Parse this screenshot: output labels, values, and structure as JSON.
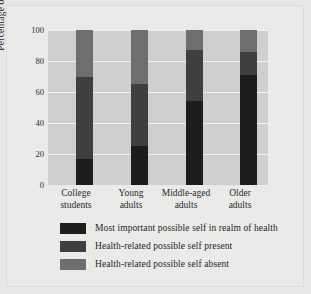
{
  "chart_data": {
    "type": "bar",
    "subtype": "stacked-bar",
    "title": "",
    "xlabel": "",
    "ylabel": "Percentage of sample",
    "ylim": [
      0,
      100
    ],
    "yticks": [
      100,
      80,
      60,
      40,
      20,
      0
    ],
    "ytick_labels": [
      "100",
      "80",
      "60",
      "40",
      "20",
      "0"
    ],
    "grid": true,
    "grid_axis": "y",
    "legend_position": "below",
    "stacked_total": 100,
    "categories": [
      "College students",
      "Young adults",
      "Middle-aged adults",
      "Older adults"
    ],
    "category_lines": [
      [
        "College",
        "students"
      ],
      [
        "Young",
        "adults"
      ],
      [
        "Middle-aged",
        "adults"
      ],
      [
        "Older",
        "adults"
      ]
    ],
    "series": [
      {
        "name": "Most important possible self in realm of health",
        "color": "#1d1d1d",
        "values": [
          17,
          25,
          54,
          71
        ]
      },
      {
        "name": "Health-related possible self present",
        "color": "#3f3f3f",
        "values": [
          53,
          40,
          33,
          15
        ]
      },
      {
        "name": "Health-related possible self absent",
        "color": "#6e6e6e",
        "values": [
          30,
          35,
          13,
          14
        ]
      }
    ],
    "cumulative_tops": [
      [
        17,
        70,
        100
      ],
      [
        25,
        65,
        100
      ],
      [
        54,
        87,
        100
      ],
      [
        71,
        86,
        100
      ]
    ],
    "colors": {
      "plot_background": "#cfcfcf",
      "figure_background": "#e8e8e6",
      "gridline": "#f2f2f0",
      "text": "#2b2b2b"
    }
  }
}
